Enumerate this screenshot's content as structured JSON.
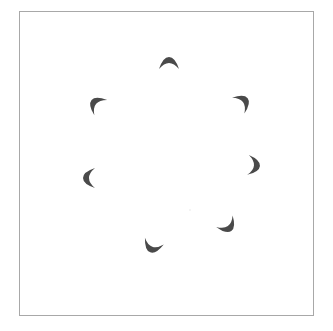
{
  "diagram": {
    "frame": {
      "x": 19,
      "y": 11,
      "width": 295,
      "height": 305,
      "stroke": "#a8a8a8",
      "stroke_width": 1.5
    },
    "ring": {
      "cx": 170,
      "cy": 162,
      "r": 82
    },
    "crescent_color": "#4a4a4a",
    "crescents": [
      {
        "id": "top",
        "x": 169,
        "y": 68,
        "angle_deg": -90
      },
      {
        "id": "upper-right",
        "x": 239,
        "y": 105,
        "angle_deg": -38
      },
      {
        "id": "right",
        "x": 249,
        "y": 165,
        "angle_deg": 5
      },
      {
        "id": "lower-right",
        "x": 225,
        "y": 222,
        "angle_deg": 55
      },
      {
        "id": "bottom",
        "x": 154,
        "y": 242,
        "angle_deg": 110
      },
      {
        "id": "left",
        "x": 94,
        "y": 178,
        "angle_deg": 180
      },
      {
        "id": "upper-left",
        "x": 100,
        "y": 107,
        "angle_deg": 220
      }
    ],
    "center_dot": {
      "x": 190,
      "y": 210,
      "color": "#e6e6e6"
    }
  }
}
